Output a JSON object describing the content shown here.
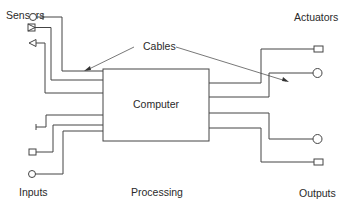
{
  "diagram": {
    "title_labels": {
      "sensors": "Sensors",
      "actuators": "Actuators",
      "cables": "Cables",
      "computer": "Computer",
      "inputs": "Inputs",
      "processing": "Processing",
      "outputs": "Outputs"
    },
    "sensors": [
      {
        "symbol": "circle-with-tick",
        "enters_y": 71
      },
      {
        "symbol": "box-with-triangle",
        "enters_y": 80
      },
      {
        "symbol": "triangle",
        "enters_y": 93
      }
    ],
    "inputs": [
      {
        "symbol": "t-bar",
        "enters_y": 115
      },
      {
        "symbol": "square",
        "enters_y": 125
      },
      {
        "symbol": "circle",
        "enters_y": 131
      }
    ],
    "actuators": [
      {
        "symbol": "square",
        "exits_y": 83
      },
      {
        "symbol": "circle",
        "exits_y": 97
      }
    ],
    "outputs": [
      {
        "symbol": "circle",
        "exits_y": 113
      },
      {
        "symbol": "square",
        "exits_y": 128
      }
    ],
    "colors": {
      "line": "#444444",
      "text": "#2a2a2a",
      "background": "#ffffff"
    }
  }
}
